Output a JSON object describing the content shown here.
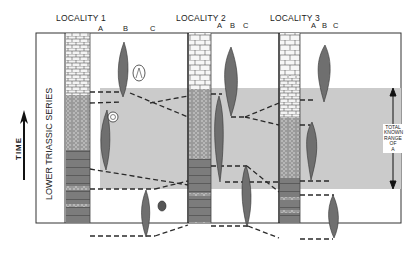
{
  "diagram": {
    "localities": [
      {
        "label": "LOCALITY 1",
        "columns": [
          "A",
          "B",
          "C"
        ]
      },
      {
        "label": "LOCALITY 2",
        "columns": [
          "A",
          "B",
          "C"
        ]
      },
      {
        "label": "LOCALITY 3",
        "columns": [
          "A",
          "B",
          "C"
        ]
      }
    ],
    "series_label": "LOWER TRIASSIC SERIES",
    "time_label": "TIME",
    "range_label": [
      "TOTAL",
      "KNOWN",
      "RANGE",
      "OF",
      "A"
    ],
    "colors": {
      "shade": "#c9c9c9",
      "fossil": "#6f6f6f",
      "line": "#2a2a2a",
      "border": "#333333"
    }
  }
}
